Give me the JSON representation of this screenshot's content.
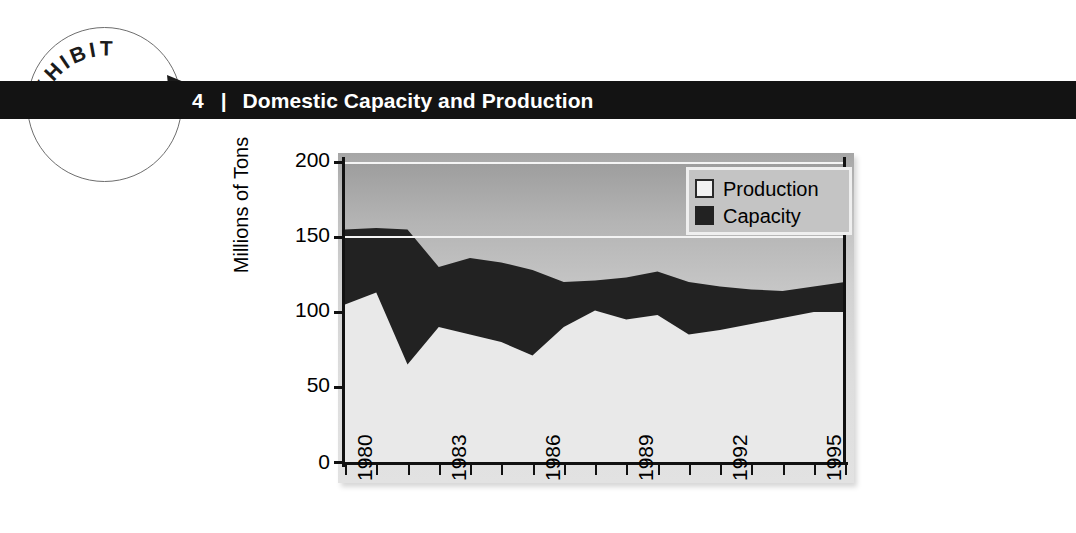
{
  "badge": {
    "word": "EXHIBIT",
    "arrow_icon": "arrow-head-icon"
  },
  "header": {
    "number": "4",
    "separator": "|",
    "title": "Domestic Capacity and Production"
  },
  "legend": {
    "items": [
      {
        "label": "Production",
        "swatch": "light",
        "color": "#f2f2f2"
      },
      {
        "label": "Capacity",
        "swatch": "dark",
        "color": "#222222"
      }
    ]
  },
  "axes": {
    "y_title": "Millions of Tons",
    "y_ticks": [
      "200",
      "150",
      "100",
      "50",
      "0"
    ],
    "x_tick_labels": [
      "1980",
      "1983",
      "1986",
      "1989",
      "1992",
      "1995"
    ]
  },
  "chart_data": {
    "type": "area",
    "title": "Domestic Capacity and Production",
    "xlabel": "",
    "ylabel": "Millions of Tons",
    "ylim": [
      0,
      200
    ],
    "xlim": [
      1980,
      1996
    ],
    "grid": false,
    "stacked_total": true,
    "legend_position": "top-right",
    "x": [
      1980,
      1981,
      1982,
      1983,
      1984,
      1985,
      1986,
      1987,
      1988,
      1989,
      1990,
      1991,
      1992,
      1993,
      1994,
      1995,
      1996
    ],
    "x_labels_shown": [
      "1980",
      "1983",
      "1986",
      "1989",
      "1992",
      "1995"
    ],
    "series": [
      {
        "name": "Capacity",
        "color": "#222222",
        "note": "upper boundary of dark band = total capacity",
        "values": [
          155,
          156,
          155,
          130,
          136,
          133,
          128,
          120,
          121,
          123,
          127,
          120,
          117,
          115,
          114,
          117,
          120
        ]
      },
      {
        "name": "Production",
        "color": "#f2f2f2",
        "note": "upper boundary of light band = production",
        "values": [
          105,
          113,
          65,
          90,
          85,
          80,
          71,
          90,
          101,
          95,
          98,
          85,
          88,
          92,
          96,
          100,
          100
        ]
      }
    ]
  }
}
